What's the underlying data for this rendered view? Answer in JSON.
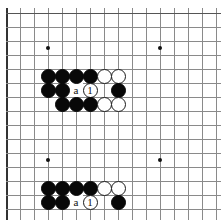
{
  "diagram": {
    "type": "go-board-problem",
    "board": {
      "grid_spacing": 14,
      "origin_x": 6,
      "origin_y": 13,
      "cols": 16,
      "rows": 15,
      "line_color": "#8a8a8a",
      "edge_color": "#333333",
      "background": "#ffffff",
      "star_points": [
        {
          "x": 48,
          "y": 48
        },
        {
          "x": 160,
          "y": 48
        },
        {
          "x": 48,
          "y": 160
        },
        {
          "x": 160,
          "y": 160
        }
      ]
    },
    "groups": [
      {
        "name": "upper-position",
        "stones": [
          {
            "color": "black",
            "x": 48,
            "y": 76
          },
          {
            "color": "black",
            "x": 62,
            "y": 76
          },
          {
            "color": "black",
            "x": 76,
            "y": 76
          },
          {
            "color": "black",
            "x": 90,
            "y": 76
          },
          {
            "color": "white",
            "x": 104,
            "y": 76
          },
          {
            "color": "white",
            "x": 118,
            "y": 76
          },
          {
            "color": "black",
            "x": 48,
            "y": 90
          },
          {
            "color": "black",
            "x": 62,
            "y": 90
          },
          {
            "color": "white",
            "x": 90,
            "y": 90,
            "label": "1"
          },
          {
            "color": "black",
            "x": 118,
            "y": 90
          },
          {
            "color": "black",
            "x": 62,
            "y": 104
          },
          {
            "color": "black",
            "x": 76,
            "y": 104
          },
          {
            "color": "black",
            "x": 90,
            "y": 104
          },
          {
            "color": "white",
            "x": 104,
            "y": 104
          },
          {
            "color": "white",
            "x": 118,
            "y": 104
          }
        ],
        "labels": [
          {
            "text": "a",
            "x": 76,
            "y": 90
          }
        ]
      },
      {
        "name": "lower-position",
        "stones": [
          {
            "color": "black",
            "x": 48,
            "y": 188
          },
          {
            "color": "black",
            "x": 62,
            "y": 188
          },
          {
            "color": "black",
            "x": 76,
            "y": 188
          },
          {
            "color": "black",
            "x": 90,
            "y": 188
          },
          {
            "color": "white",
            "x": 104,
            "y": 188
          },
          {
            "color": "white",
            "x": 118,
            "y": 188
          },
          {
            "color": "black",
            "x": 48,
            "y": 202
          },
          {
            "color": "black",
            "x": 62,
            "y": 202
          },
          {
            "color": "white",
            "x": 90,
            "y": 202,
            "label": "1"
          },
          {
            "color": "black",
            "x": 118,
            "y": 202
          }
        ],
        "labels": [
          {
            "text": "a",
            "x": 76,
            "y": 202
          }
        ]
      }
    ]
  }
}
